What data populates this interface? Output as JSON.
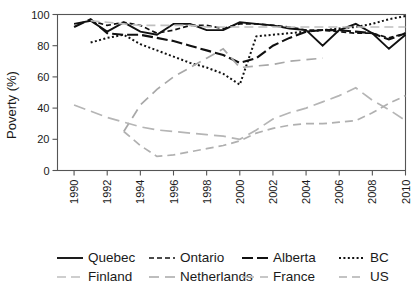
{
  "chart_data": {
    "type": "line",
    "title": "",
    "subtitle": "",
    "xlabel": "",
    "ylabel": "Poverty (%)",
    "xlim": [
      1989,
      2010
    ],
    "ylim": [
      0,
      100
    ],
    "grid": false,
    "legend_position": "bottom",
    "legend_columns": 4,
    "legend_rows": 2,
    "xticks": [
      1990,
      1992,
      1994,
      1996,
      1998,
      2000,
      2002,
      2004,
      2006,
      2008,
      2010
    ],
    "xtick_labels": [
      "1990",
      "1992",
      "1994",
      "1996",
      "1998",
      "2000",
      "2002",
      "2004",
      "2006",
      "2008",
      "2010"
    ],
    "xtick_rotation": 90,
    "yticks": [
      0,
      20,
      40,
      60,
      80,
      100
    ],
    "ytick_labels": [
      "0",
      "20",
      "40",
      "60",
      "80",
      "100"
    ],
    "series": [
      {
        "name": "Quebec",
        "color": "#111111",
        "dash": "solid",
        "dasharray": "",
        "width": 1.9,
        "x": [
          1990,
          1991,
          1992,
          1993,
          1994,
          1995,
          1996,
          1997,
          1998,
          1999,
          2000,
          2001,
          2002,
          2003,
          2004,
          2005,
          2006,
          2007,
          2008,
          2009,
          2010
        ],
        "y": [
          94,
          96,
          89,
          95,
          89,
          87,
          94,
          94,
          90,
          90,
          95,
          94,
          93,
          91,
          90,
          80,
          90,
          94,
          88,
          78,
          87
        ]
      },
      {
        "name": "Ontario",
        "color": "#111111",
        "dash": "short-dash",
        "dasharray": "5,3",
        "width": 1.7,
        "x": [
          1991,
          1992,
          1993,
          1994,
          1995,
          1996,
          1997,
          1998,
          1999,
          2000,
          2001,
          2002,
          2003,
          2004,
          2005,
          2006,
          2007,
          2008,
          2009,
          2010
        ],
        "y": [
          96,
          93,
          95,
          93,
          88,
          90,
          93,
          93,
          91,
          94,
          94,
          93,
          92,
          90,
          90,
          89,
          88,
          88,
          85,
          88
        ]
      },
      {
        "name": "Alberta",
        "color": "#111111",
        "dash": "long-dash",
        "dasharray": "11,4",
        "width": 2.1,
        "x": [
          1990,
          1991,
          1992,
          1993,
          1994,
          1995,
          1996,
          1997,
          1998,
          1999,
          2000,
          2001,
          2002,
          2003,
          2004,
          2005,
          2006,
          2007,
          2008,
          2009,
          2010
        ],
        "y": [
          92,
          97,
          88,
          87,
          87,
          85,
          83,
          80,
          77,
          74,
          69,
          72,
          80,
          85,
          89,
          90,
          90,
          89,
          88,
          84,
          88
        ]
      },
      {
        "name": "BC",
        "color": "#111111",
        "dash": "dotted",
        "dasharray": "2,2.4",
        "width": 2.0,
        "x": [
          1991,
          1992,
          1993,
          1994,
          1995,
          1996,
          1997,
          1998,
          1999,
          2000,
          2001,
          2002,
          2003,
          2004,
          2005,
          2006,
          2007,
          2008,
          2009,
          2010
        ],
        "y": [
          82,
          85,
          87,
          81,
          77,
          73,
          69,
          66,
          62,
          55,
          86,
          87,
          88,
          89,
          90,
          91,
          92,
          94,
          97,
          99
        ]
      },
      {
        "name": "Finland",
        "color": "#bfbfbf",
        "dash": "gray-dash-a",
        "dasharray": "9,5",
        "width": 1.6,
        "x": [
          1991,
          1992,
          1993,
          1994,
          1995,
          1996,
          1997,
          1998,
          1999,
          2000,
          2001,
          2002,
          2003,
          2004,
          2005,
          2006,
          2007,
          2008,
          2009,
          2010
        ],
        "y": [
          96,
          95,
          94,
          93,
          93,
          93,
          93,
          92,
          92,
          92,
          92,
          92,
          92,
          92,
          92,
          92,
          92,
          92,
          92,
          92
        ]
      },
      {
        "name": "Netherlands",
        "color": "#a8a8a8",
        "dash": "gray-dash-b",
        "dasharray": "10,6",
        "width": 1.7,
        "x": [
          1993,
          1994,
          1995,
          1996,
          1997,
          1998,
          1999,
          2000,
          2001,
          2002,
          2003,
          2004,
          2005
        ],
        "y": [
          25,
          42,
          52,
          60,
          66,
          72,
          78,
          66,
          67,
          68,
          70,
          71,
          72
        ]
      },
      {
        "name": "France",
        "color": "#b5b5b5",
        "dash": "gray-dash-c",
        "dasharray": "12,6",
        "width": 1.7,
        "x": [
          1990,
          1991,
          1992,
          1993,
          1994,
          1995,
          1996,
          1997,
          1998,
          1999,
          2000,
          2001,
          2002,
          2003,
          2004,
          2005,
          2006,
          2007,
          2008,
          2009,
          2010
        ],
        "y": [
          42,
          38,
          34,
          31,
          28,
          26,
          25,
          24,
          23,
          22,
          20,
          26,
          33,
          37,
          40,
          44,
          48,
          53,
          45,
          39,
          32
        ]
      },
      {
        "name": "US",
        "color": "#b0b0b0",
        "dash": "gray-dash-d",
        "dasharray": "8,5",
        "width": 1.7,
        "x": [
          1993,
          1994,
          1995,
          1996,
          1997,
          1998,
          1999,
          2000,
          2001,
          2002,
          2003,
          2004,
          2005,
          2006,
          2007,
          2008,
          2009,
          2010
        ],
        "y": [
          25,
          16,
          9,
          10,
          12,
          14,
          16,
          19,
          24,
          27,
          29,
          30,
          30,
          31,
          32,
          37,
          43,
          48
        ]
      }
    ]
  },
  "legend": {
    "items": [
      {
        "label": "Quebec",
        "series": "Quebec"
      },
      {
        "label": "Ontario",
        "series": "Ontario"
      },
      {
        "label": "Alberta",
        "series": "Alberta"
      },
      {
        "label": "BC",
        "series": "BC"
      },
      {
        "label": "Finland",
        "series": "Finland"
      },
      {
        "label": "Netherlands",
        "series": "Netherlands"
      },
      {
        "label": "France",
        "series": "France"
      },
      {
        "label": "US",
        "series": "US"
      }
    ]
  },
  "colors": {
    "axis": "#555555",
    "text": "#1a1a1a",
    "background": "#ffffff",
    "dark_series": "#111111",
    "gray_series": "#b0b0b0"
  }
}
